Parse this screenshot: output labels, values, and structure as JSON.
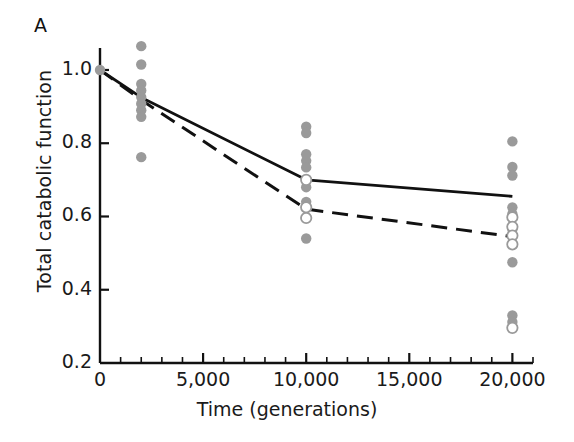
{
  "panel": {
    "label": "A"
  },
  "chart_data": {
    "type": "scatter",
    "title": "",
    "xlabel": "Time (generations)",
    "ylabel": "Total catabolic function",
    "xlim": [
      0,
      21000
    ],
    "ylim": [
      0.2,
      1.06
    ],
    "grid": false,
    "legend": "none",
    "xticks": [
      0,
      5000,
      10000,
      15000,
      20000
    ],
    "xtick_labels": [
      "0",
      "5,000",
      "10,000",
      "15,000",
      "20,000"
    ],
    "xminor_step": 1000,
    "yticks": [
      0.2,
      0.4,
      0.6,
      0.8,
      1.0
    ],
    "ytick_labels": [
      "0.2",
      "0.4",
      "0.6",
      "0.8",
      "1.0"
    ],
    "colors": {
      "point_filled": "#9a9a9a",
      "point_open_edge": "#9a9a9a",
      "point_open_fill": "#ffffff",
      "line_solid": "#111111",
      "line_dashed": "#111111",
      "axis": "#111111"
    },
    "series": [
      {
        "name": "mean-solid",
        "style": "solid",
        "x": [
          0,
          2000,
          10000,
          20000
        ],
        "values": [
          1.0,
          0.925,
          0.7,
          0.655
        ]
      },
      {
        "name": "mean-dashed",
        "style": "dashed",
        "x": [
          0,
          2000,
          10000,
          20000
        ],
        "values": [
          1.0,
          0.918,
          0.62,
          0.545
        ]
      }
    ],
    "points_filled": [
      {
        "x": 0,
        "y": 1.0
      },
      {
        "x": 2000,
        "y": 1.065
      },
      {
        "x": 2000,
        "y": 1.015
      },
      {
        "x": 2000,
        "y": 0.962
      },
      {
        "x": 2000,
        "y": 0.944
      },
      {
        "x": 2000,
        "y": 0.926
      },
      {
        "x": 2000,
        "y": 0.908
      },
      {
        "x": 2000,
        "y": 0.89
      },
      {
        "x": 2000,
        "y": 0.872
      },
      {
        "x": 2000,
        "y": 0.762
      },
      {
        "x": 10000,
        "y": 0.845
      },
      {
        "x": 10000,
        "y": 0.828
      },
      {
        "x": 10000,
        "y": 0.77
      },
      {
        "x": 10000,
        "y": 0.752
      },
      {
        "x": 10000,
        "y": 0.734
      },
      {
        "x": 10000,
        "y": 0.68
      },
      {
        "x": 10000,
        "y": 0.64
      },
      {
        "x": 10000,
        "y": 0.54
      },
      {
        "x": 20000,
        "y": 0.805
      },
      {
        "x": 20000,
        "y": 0.735
      },
      {
        "x": 20000,
        "y": 0.712
      },
      {
        "x": 20000,
        "y": 0.625
      },
      {
        "x": 20000,
        "y": 0.607
      },
      {
        "x": 20000,
        "y": 0.565
      },
      {
        "x": 20000,
        "y": 0.475
      },
      {
        "x": 20000,
        "y": 0.33
      },
      {
        "x": 20000,
        "y": 0.312
      }
    ],
    "points_open": [
      {
        "x": 10000,
        "y": 0.7
      },
      {
        "x": 10000,
        "y": 0.625
      },
      {
        "x": 10000,
        "y": 0.596
      },
      {
        "x": 20000,
        "y": 0.598
      },
      {
        "x": 20000,
        "y": 0.572
      },
      {
        "x": 20000,
        "y": 0.548
      },
      {
        "x": 20000,
        "y": 0.524
      },
      {
        "x": 20000,
        "y": 0.296
      }
    ]
  }
}
